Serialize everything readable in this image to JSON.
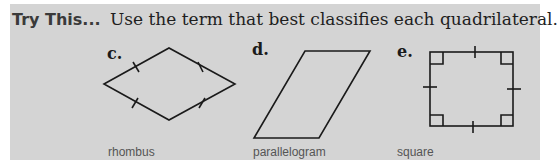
{
  "heading": {
    "lead": "Try This...",
    "instruction": "Use the term that best classifies each quadrilateral."
  },
  "items": [
    {
      "letter": "c.",
      "shape": "rhombus-figure",
      "answer": "rhombus"
    },
    {
      "letter": "d.",
      "shape": "parallelogram-figure",
      "answer": "parallelogram"
    },
    {
      "letter": "e.",
      "shape": "square-figure",
      "answer": "square"
    }
  ],
  "colors": {
    "panel_background": "#d4d4d4",
    "line": "#1a1a1a",
    "answer_text": "#555555"
  }
}
